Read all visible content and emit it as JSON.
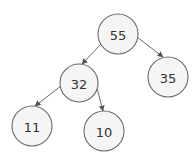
{
  "diagram": {
    "type": "binary-tree",
    "colors": {
      "node_fill": "#f5f5f5",
      "node_stroke": "#6a6a6a",
      "edge": "#6a6a6a",
      "text": "#333333"
    },
    "nodes": [
      {
        "id": "n55",
        "label": "55",
        "cx": 118,
        "cy": 34,
        "r": 20
      },
      {
        "id": "n32",
        "label": "32",
        "cx": 79,
        "cy": 83,
        "r": 19
      },
      {
        "id": "n35",
        "label": "35",
        "cx": 168,
        "cy": 77,
        "r": 20
      },
      {
        "id": "n11",
        "label": "11",
        "cx": 32,
        "cy": 126,
        "r": 20
      },
      {
        "id": "n10",
        "label": "10",
        "cx": 104,
        "cy": 131,
        "r": 20
      }
    ],
    "edges": [
      {
        "from": "55",
        "to": "32"
      },
      {
        "from": "55",
        "to": "35"
      },
      {
        "from": "32",
        "to": "11"
      },
      {
        "from": "32",
        "to": "10"
      }
    ]
  }
}
